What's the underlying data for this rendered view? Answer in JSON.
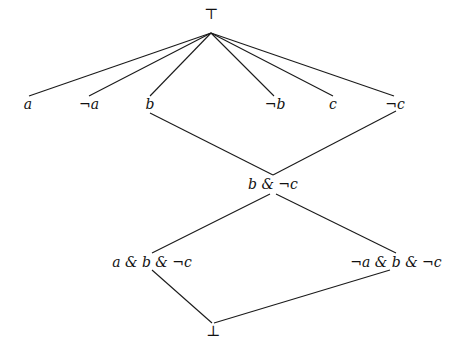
{
  "diagram": {
    "type": "lattice",
    "top": {
      "label": "⊤",
      "x": 211,
      "y": 14
    },
    "bottom": {
      "label": "⊥",
      "x": 213,
      "y": 331
    },
    "atoms": [
      {
        "label": "a",
        "x": 28,
        "y": 104
      },
      {
        "label": "¬a",
        "x": 89,
        "y": 104
      },
      {
        "label": "b",
        "x": 150,
        "y": 104
      },
      {
        "label": "¬b",
        "x": 275,
        "y": 104
      },
      {
        "label": "c",
        "x": 333,
        "y": 104
      },
      {
        "label": "¬c",
        "x": 395,
        "y": 104
      }
    ],
    "meet": {
      "label": "b & ¬c",
      "x": 273,
      "y": 184
    },
    "conjunctions": [
      {
        "label": "a & b & ¬c",
        "x": 152,
        "y": 262
      },
      {
        "label": "¬a & b & ¬c",
        "x": 396,
        "y": 262
      }
    ],
    "edges": [
      {
        "from": "⊤",
        "to": "a"
      },
      {
        "from": "⊤",
        "to": "¬a"
      },
      {
        "from": "⊤",
        "to": "b"
      },
      {
        "from": "⊤",
        "to": "¬b"
      },
      {
        "from": "⊤",
        "to": "c"
      },
      {
        "from": "⊤",
        "to": "¬c"
      },
      {
        "from": "b",
        "to": "b & ¬c"
      },
      {
        "from": "¬c",
        "to": "b & ¬c"
      },
      {
        "from": "b & ¬c",
        "to": "a & b & ¬c"
      },
      {
        "from": "b & ¬c",
        "to": "¬a & b & ¬c"
      },
      {
        "from": "a & b & ¬c",
        "to": "⊥"
      },
      {
        "from": "¬a & b & ¬c",
        "to": "⊥"
      }
    ]
  }
}
